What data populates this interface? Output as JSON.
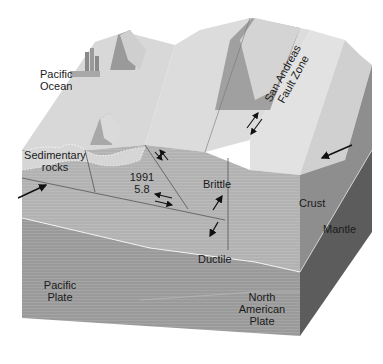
{
  "labels": {
    "pacific_ocean": [
      "Pacific",
      "Ocean"
    ],
    "san_andreas": [
      "San Andreas",
      "Fault Zone"
    ],
    "sedimentary_rocks": [
      "Sedimentary",
      "rocks"
    ],
    "quake_year": "1991",
    "quake_magnitude": "5.8",
    "brittle": "Brittle",
    "ductile": "Ductile",
    "crust": "Crust",
    "mantle": "Mantle",
    "pacific_plate": [
      "Pacific",
      "Plate"
    ],
    "north_american_plate": [
      "North",
      "American",
      "Plate"
    ]
  },
  "colors": {
    "surface": "#d6d6d6",
    "surface_light": "#e6e6e6",
    "crust_face": "#a8a8a8",
    "crust_front": "#b4b4b4",
    "mantle_front": "#8e8e8e",
    "side_crust": "#8a8a8a",
    "side_mantle": "#5e5e5e",
    "mountain": "#8c8c8c",
    "arrow": "#111111"
  }
}
